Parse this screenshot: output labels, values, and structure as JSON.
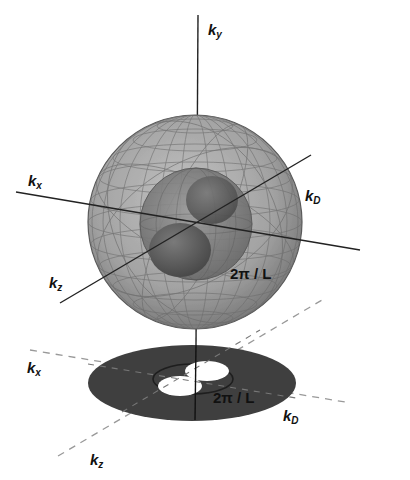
{
  "figure": {
    "colors": {
      "outer_sphere_fill": "#9a9a9a",
      "inner_sphere_fill": "#6e6e6e",
      "core_fill": "#555555",
      "disk_fill": "#3f3f3f",
      "axis": "#222222",
      "dash": "#9a9a9a"
    }
  },
  "labels_3d": {
    "ky": {
      "base": "k",
      "sub": "y"
    },
    "kx": {
      "base": "k",
      "sub": "x"
    },
    "kz": {
      "base": "k",
      "sub": "z"
    },
    "kD": {
      "base": "k",
      "sub": "D"
    },
    "inner_radius": "2π / L"
  },
  "labels_2d": {
    "kx": {
      "base": "k",
      "sub": "x"
    },
    "kz": {
      "base": "k",
      "sub": "z"
    },
    "kD": {
      "base": "k",
      "sub": "D"
    },
    "inner_radius": "2π / L"
  }
}
